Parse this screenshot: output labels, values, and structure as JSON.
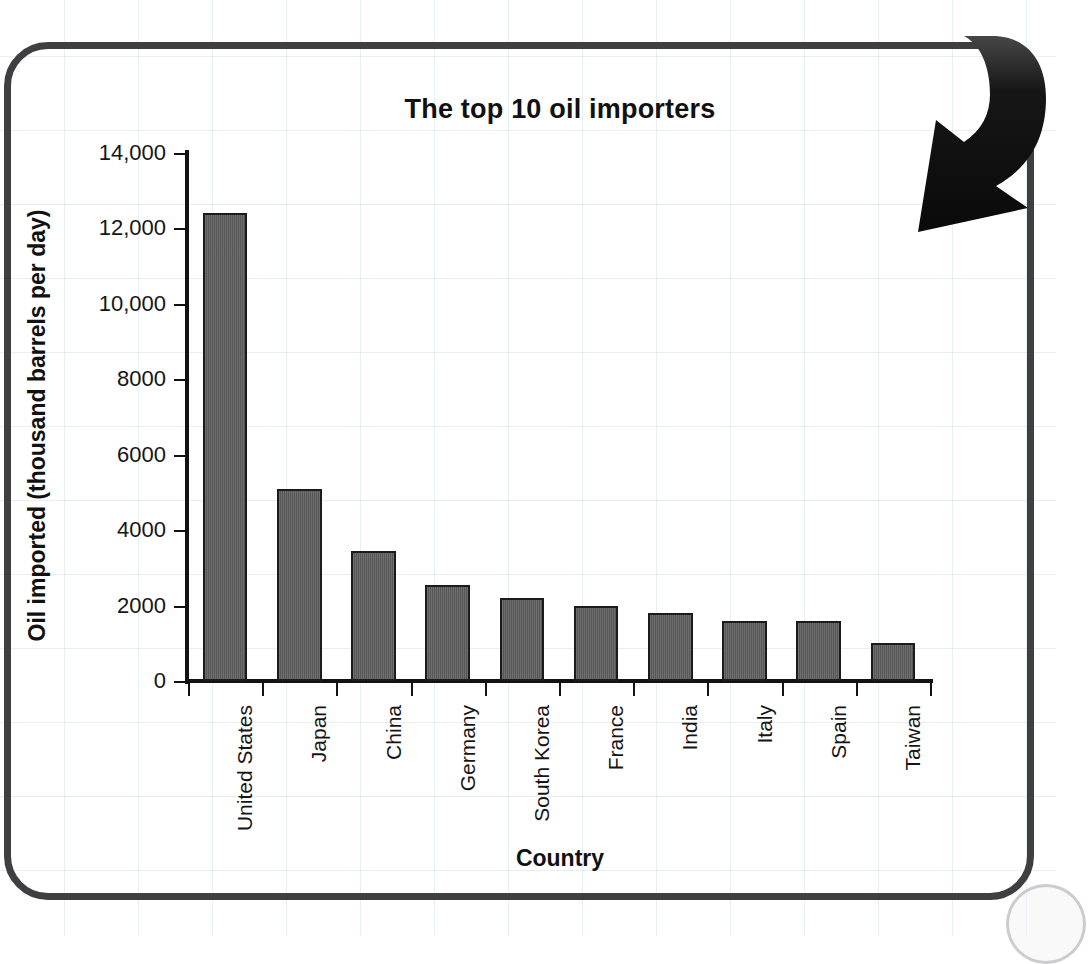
{
  "page": {
    "background_color": "#ffffff",
    "grid_color": "#aac3d7",
    "panel_border_color": "#3f3f41"
  },
  "decorations": {
    "arrow": {
      "name": "curved-down-left-arrow",
      "color": "#0d0d0d"
    },
    "corner_circle": {
      "name": "page-corner-circle"
    }
  },
  "chart_data": {
    "type": "bar",
    "title": "The top 10 oil importers",
    "xlabel": "Country",
    "ylabel": "Oil imported (thousand barrels per day)",
    "categories": [
      "United States",
      "Japan",
      "China",
      "Germany",
      "South Korea",
      "France",
      "India",
      "Italy",
      "Spain",
      "Taiwan"
    ],
    "values": [
      12400,
      5100,
      3450,
      2550,
      2200,
      2000,
      1800,
      1600,
      1600,
      1000
    ],
    "ylim": [
      0,
      14000
    ],
    "ytick_values": [
      0,
      2000,
      4000,
      6000,
      8000,
      10000,
      12000,
      14000
    ],
    "ytick_labels": [
      "0",
      "2000",
      "4000",
      "6000",
      "8000",
      "10,000",
      "12,000",
      "14,000"
    ],
    "grid": false,
    "legend": null,
    "bar_color": "#5d5d5d",
    "bar_edge_color": "#1b1b1b"
  }
}
